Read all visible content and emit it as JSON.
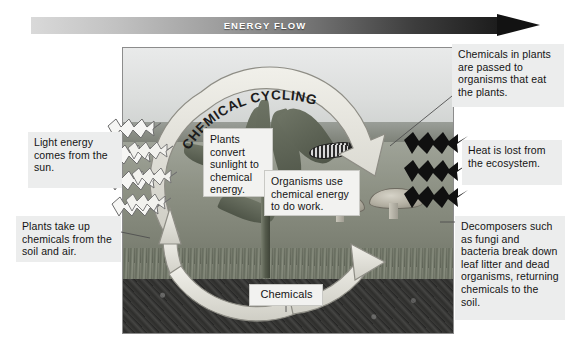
{
  "diagram": {
    "title_banner": "ENERGY FLOW",
    "cycle_label": "CHEMICAL CYCLING",
    "cycle_label_letters": [
      "C",
      "H",
      "E",
      "M",
      "I",
      "C",
      "A",
      "L",
      " ",
      "C",
      "Y",
      "C",
      "L",
      "I",
      "N",
      "G"
    ]
  },
  "callouts": {
    "chemicals_passed": "Chemicals in plants are passed to organisms that eat the plants.",
    "heat_lost": "Heat is lost from the ecosystem.",
    "decomposers": "Decomposers such as fungi and bacteria break down leaf litter and dead organisms, returning chemicals to the soil.",
    "light_energy": "Light energy comes from the sun.",
    "plants_uptake": "Plants take up chemicals from the soil and air.",
    "plants_convert": "Plants convert sunlight to chemical energy.",
    "organisms_use": "Organisms use chemical energy to do work.",
    "chemicals": "Chemicals"
  },
  "colors": {
    "banner_start": "#d9d9d9",
    "banner_end": "#121212",
    "banner_text": "#ffffff",
    "callout_bg": "#efeff0",
    "callout_text": "#141414",
    "leader_line": "#5c5c5c",
    "cycle_arrow_fill": "#e4e3dc",
    "cycle_arrow_stroke": "#8e8d85",
    "heat_zigzag": "#111111",
    "light_zigzag": "#f4f4f2"
  },
  "icons": {
    "energy_flow_arrow": "right-arrow-icon",
    "cycle_arrow": "circular-arrow-icon",
    "light_zigzag_arrow": "zigzag-arrow-icon",
    "heat_zigzag_arrow": "zigzag-arrow-icon"
  }
}
